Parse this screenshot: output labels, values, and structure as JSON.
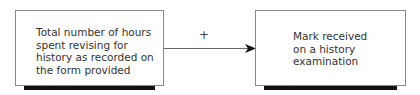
{
  "diagram": {
    "left_box": {
      "text": "Total number of hours\nspent revising for\nhistory as recorded on\nthe form provided"
    },
    "right_box": {
      "text": "Mark received\non a history\nexamination"
    },
    "relation": {
      "sign": "+",
      "direction": "left-to-right"
    }
  }
}
